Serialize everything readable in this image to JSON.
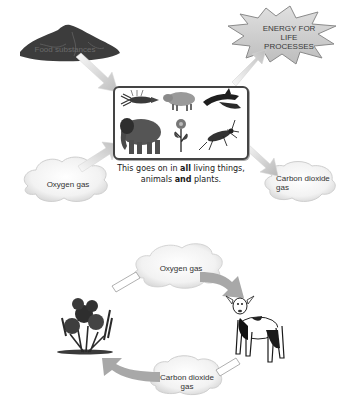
{
  "diagram": {
    "top": {
      "input_food": {
        "label": "Food substances",
        "icon": "food-pile-icon"
      },
      "output_energy": {
        "label_lines": [
          "ENERGY FOR",
          "LIFE",
          "PROCESSES"
        ],
        "icon": "starburst-icon"
      },
      "input_oxygen": {
        "label": "Oxygen gas",
        "icon": "cloud-icon"
      },
      "output_co2": {
        "label_lines": [
          "Carbon dioxide",
          "gas"
        ],
        "icon": "cloud-icon"
      },
      "organisms_box": {
        "items": [
          "lobster-icon",
          "pig-icon",
          "dolphin-icon",
          "elephant-icon",
          "flower-icon",
          "insect-icon"
        ]
      },
      "caption": {
        "part1": "This goes on ",
        "part2": "in ",
        "bold1": "all",
        "part3": " living things,",
        "part4": "animals ",
        "bold2": "and",
        "part5": " plants."
      }
    },
    "bottom_cycle": {
      "oxygen": {
        "label": "Oxygen gas"
      },
      "co2": {
        "label_lines": [
          "Carbon dioxide",
          "gas"
        ]
      },
      "plant": {
        "icon": "plant-icon"
      },
      "animal": {
        "icon": "lamb-icon"
      }
    },
    "colors": {
      "arrow_fill": "#c8c8c8",
      "arrow_fade": "#f2f2f2",
      "dark_pile": "#3c3c3c",
      "burst_fill": "#d4d4d4",
      "cloud_fill": "#f4f4f4",
      "box_border": "#444444"
    }
  }
}
